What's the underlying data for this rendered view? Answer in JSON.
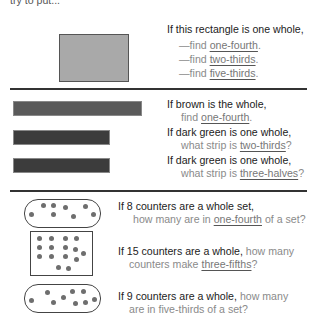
{
  "top_cut_text": "try to put...",
  "section1": {
    "shape": {
      "type": "rectangle",
      "color": "#a9a9a9"
    },
    "prompt": "If this rectangle is one whole,",
    "items": [
      {
        "prefix": "—find ",
        "fraction": "one-fourth",
        "suffix": "."
      },
      {
        "prefix": "—find ",
        "fraction": "two-thirds",
        "suffix": "."
      },
      {
        "prefix": "—find ",
        "fraction": "five-thirds",
        "suffix": "."
      }
    ]
  },
  "section2": {
    "strips": [
      {
        "name": "brown",
        "color": "#5a5a5a",
        "line1": "If brown is the whole,",
        "line2_prefix": "find ",
        "fraction": "one-fourth",
        "line2_suffix": "."
      },
      {
        "name": "dark green",
        "color": "#3c3c3c",
        "line1": "If dark green is one whole,",
        "line2_prefix": "what strip is ",
        "fraction": "two-thirds",
        "line2_suffix": "?"
      },
      {
        "name": "dark green",
        "color": "#3c3c3c",
        "line1": "If dark green is one whole,",
        "line2_prefix": "what strip is ",
        "fraction": "three-halves",
        "line2_suffix": "?"
      }
    ]
  },
  "section3": {
    "sets": [
      {
        "counters": 8,
        "container": "pill",
        "line1": "If 8 counters are a whole set,",
        "line2_prefix": "how many are in ",
        "fraction": "one-fourth",
        "line2_suffix": " of a set?"
      },
      {
        "counters": 15,
        "container": "box",
        "line1_dark": "If 15 counters are a whole,",
        "line1_gray": " how many",
        "line2_prefix": "counters make ",
        "fraction": "three-fifths",
        "line2_suffix": "?"
      },
      {
        "counters": 9,
        "container": "pill",
        "line1_dark": "If 9 counters are a whole,",
        "line1_gray": " how many",
        "line2": "are in five-thirds of a set?"
      }
    ]
  },
  "colors": {
    "rule": "#333333",
    "counter": "#6e6e6e",
    "secondary_text": "#8a8a8a"
  }
}
